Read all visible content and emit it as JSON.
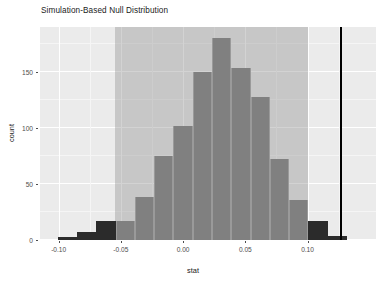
{
  "chart_data": {
    "type": "bar",
    "title": "Simulation-Based Null Distribution",
    "xlabel": "stat",
    "ylabel": "count",
    "xlim": [
      -0.115,
      0.155
    ],
    "ylim": [
      0,
      190
    ],
    "grid": true,
    "legend": null,
    "xticks": [
      -0.1,
      -0.05,
      0.0,
      0.05,
      0.1
    ],
    "xticklabels": [
      "-0.10",
      "-0.05",
      "0.00",
      "0.05",
      "0.10"
    ],
    "yticks": [
      0,
      50,
      100,
      150
    ],
    "yticklabels": [
      "0",
      "50",
      "100",
      "150"
    ],
    "bin_width": 0.0155,
    "bars": [
      {
        "x_center": -0.093,
        "value": 3,
        "color": "#2b2b2b",
        "shaded": false
      },
      {
        "x_center": -0.0775,
        "value": 7,
        "color": "#2b2b2b",
        "shaded": false
      },
      {
        "x_center": -0.062,
        "value": 17,
        "color": "#2b2b2b",
        "shaded": false
      },
      {
        "x_center": -0.0465,
        "value": 17,
        "color": "#808080",
        "shaded": true
      },
      {
        "x_center": -0.031,
        "value": 38,
        "color": "#808080",
        "shaded": true
      },
      {
        "x_center": -0.0155,
        "value": 75,
        "color": "#808080",
        "shaded": true
      },
      {
        "x_center": 0.0,
        "value": 102,
        "color": "#808080",
        "shaded": true
      },
      {
        "x_center": 0.0155,
        "value": 150,
        "color": "#808080",
        "shaded": true
      },
      {
        "x_center": 0.031,
        "value": 180,
        "color": "#808080",
        "shaded": true
      },
      {
        "x_center": 0.0465,
        "value": 153,
        "color": "#808080",
        "shaded": true
      },
      {
        "x_center": 0.062,
        "value": 128,
        "color": "#808080",
        "shaded": true
      },
      {
        "x_center": 0.0775,
        "value": 72,
        "color": "#808080",
        "shaded": true
      },
      {
        "x_center": 0.093,
        "value": 36,
        "color": "#808080",
        "shaded": true
      },
      {
        "x_center": 0.1085,
        "value": 17,
        "color": "#2b2b2b",
        "shaded": false
      },
      {
        "x_center": 0.124,
        "value": 4,
        "color": "#2b2b2b",
        "shaded": false
      }
    ],
    "shaded_region": {
      "from": -0.0545,
      "to": 0.1005,
      "color": "#969696"
    },
    "observed_stat_line": {
      "x": 0.1272,
      "color": "#000000"
    }
  },
  "colors": {
    "panel_background": "#ebebeb",
    "gridline_major": "#ffffff",
    "bar_fill": "#808080",
    "bar_fill_tail": "#2b2b2b",
    "shade_fill": "#969696",
    "stat_line": "#000000",
    "text": "#1a1a1a",
    "tick_text": "#4d4d4d"
  }
}
